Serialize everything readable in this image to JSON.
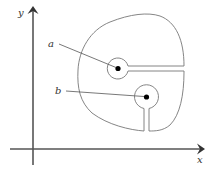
{
  "diagram": {
    "type": "complex-plane-region-with-keyhole-cuts",
    "axes": {
      "x_label": "x",
      "y_label": "y"
    },
    "points": [
      {
        "label": "a",
        "description": "center of upper circular hole with horizontal cut to the right boundary"
      },
      {
        "label": "b",
        "description": "center of lower circular hole with vertical cut to the bottom boundary"
      }
    ],
    "colors": {
      "axis": "#555555",
      "contour": "#777777",
      "point": "#000000",
      "text": "#333333"
    }
  }
}
